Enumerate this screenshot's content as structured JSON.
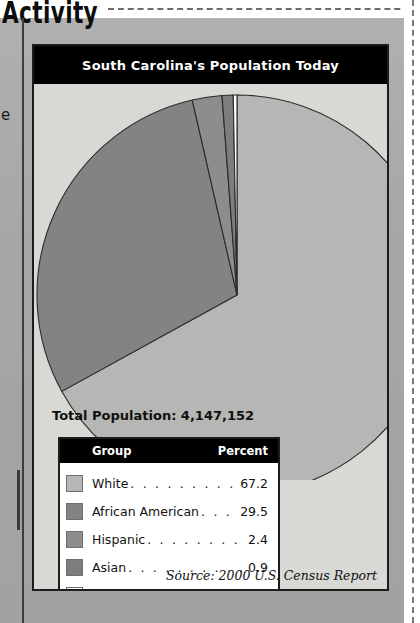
{
  "page": {
    "section_heading": "Activity",
    "margin_fragment": "e"
  },
  "chart_panel": {
    "title": "South Carolina's Population Today",
    "total_population_label": "Total Population: 4,147,152",
    "source": "Source: 2000 U.S. Census Report",
    "legend_headers": {
      "group": "Group",
      "percent": "Percent"
    },
    "dots": ". . . . . . . . . . . . . . . . . . . ."
  },
  "chart_data": {
    "type": "pie",
    "title": "South Carolina's Population Today",
    "total_population": "4,147,152",
    "source": "Source: 2000 U.S. Census Report",
    "unit": "percent",
    "start_angle_deg": 0,
    "direction": "clockwise",
    "legend_position": "below-left",
    "categories": [
      "White",
      "African American",
      "Hispanic",
      "Asian",
      "Native American"
    ],
    "values": [
      67.2,
      29.5,
      2.4,
      0.9,
      0.3
    ],
    "value_labels": [
      "67.2",
      "29.5",
      "2.4",
      "0.9",
      "0.3"
    ],
    "colors": [
      "#b6b6b4",
      "#838383",
      "#8d8d8d",
      "#7d7d7d",
      "#ffffff"
    ],
    "slices": [
      {
        "label": "White",
        "value": 67.2,
        "color": "#b6b6b4"
      },
      {
        "label": "African American",
        "value": 29.5,
        "color": "#838383"
      },
      {
        "label": "Hispanic",
        "value": 2.4,
        "color": "#8d8d8d"
      },
      {
        "label": "Asian",
        "value": 0.9,
        "color": "#7d7d7d"
      },
      {
        "label": "Native American",
        "value": 0.3,
        "color": "#ffffff"
      }
    ],
    "xlabel": "",
    "ylabel": ""
  }
}
